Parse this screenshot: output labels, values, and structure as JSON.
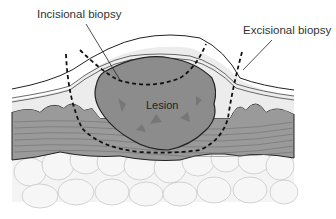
{
  "diagram": {
    "labels": {
      "incisional": "Incisional biopsy",
      "excisional": "Excisional biopsy",
      "lesion": "Lesion"
    },
    "colors": {
      "lesion": "#8c8c8c",
      "muscle": "#9a9a9a",
      "epidermis": "#e6e6e6",
      "fat": "#f4f4f4",
      "outline": "#222222"
    }
  }
}
